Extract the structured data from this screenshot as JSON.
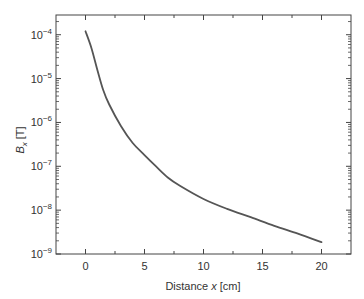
{
  "chart_data": {
    "type": "line",
    "title": "",
    "xlabel": "Distance x [cm]",
    "xlabel_parts": {
      "prefix": "Distance ",
      "var": "x",
      "suffix": " [cm]"
    },
    "ylabel": "Bx [T]",
    "ylabel_parts": {
      "var": "B",
      "sub": "x",
      "suffix": " [T]"
    },
    "xscale": "linear",
    "yscale": "log",
    "xlim": [
      -2.5,
      22.5
    ],
    "ylim": [
      0.00028,
      1e-09
    ],
    "ylim_log10": [
      -9,
      -3.55
    ],
    "xticks": [
      0,
      5,
      10,
      15,
      20
    ],
    "xtick_labels": [
      "0",
      "5",
      "10",
      "15",
      "20"
    ],
    "xminor_ticks": [
      2.5,
      7.5,
      12.5,
      17.5
    ],
    "yticks_log10": [
      -9,
      -8,
      -7,
      -6,
      -5,
      -4
    ],
    "ytick_labels": [
      {
        "base": "10",
        "exp": "−9"
      },
      {
        "base": "10",
        "exp": "−8"
      },
      {
        "base": "10",
        "exp": "−7"
      },
      {
        "base": "10",
        "exp": "−6"
      },
      {
        "base": "10",
        "exp": "−5"
      },
      {
        "base": "10",
        "exp": "−4"
      }
    ],
    "grid": false,
    "legend": null,
    "series": [
      {
        "name": "Bx",
        "color": "#555555",
        "x": [
          0,
          0.5,
          1,
          1.5,
          2,
          3,
          4,
          5,
          6,
          7,
          8,
          10,
          12,
          14,
          16,
          18,
          20
        ],
        "y": [
          0.00012,
          5e-05,
          1.6e-05,
          5.5e-06,
          2.6e-06,
          8.3e-07,
          3.4e-07,
          1.8e-07,
          9.8e-08,
          5.5e-08,
          3.6e-08,
          1.8e-08,
          1.07e-08,
          6.9e-09,
          4.4e-09,
          2.9e-09,
          1.86e-09
        ]
      }
    ]
  },
  "style": {
    "axis_color": "#444444",
    "line_color": "#555555",
    "text_color": "#333333"
  }
}
